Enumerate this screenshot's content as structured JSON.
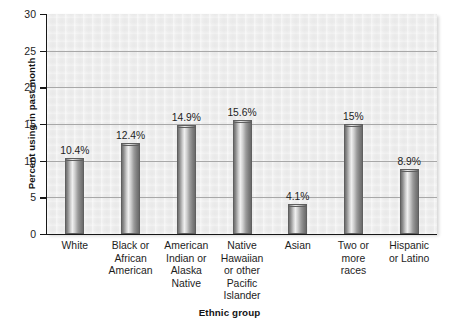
{
  "chart_data": {
    "type": "bar",
    "title": "",
    "xlabel": "Ethnic group",
    "ylabel": "Percent using in past month",
    "ylim": [
      0,
      30
    ],
    "yticks": [
      0,
      5,
      10,
      15,
      20,
      25,
      30
    ],
    "ytick_labels": [
      "0",
      "5",
      "10",
      "15",
      "20",
      "25",
      "30"
    ],
    "grid": true,
    "legend": "none",
    "categories": [
      "White",
      "Black or African American",
      "American Indian or Alaska Native",
      "Native Hawaiian or other Pacific Islander",
      "Asian",
      "Two or more races",
      "Hispanic or Latino"
    ],
    "category_label_lines": [
      [
        "White"
      ],
      [
        "Black or",
        "African",
        "American"
      ],
      [
        "American",
        "Indian or",
        "Alaska",
        "Native"
      ],
      [
        "Native",
        "Hawaiian",
        "or other",
        "Pacific",
        "Islander"
      ],
      [
        "Asian"
      ],
      [
        "Two or",
        "more",
        "races"
      ],
      [
        "Hispanic",
        "or Latino"
      ]
    ],
    "values": [
      10.4,
      12.4,
      14.9,
      15.6,
      4.1,
      15.0,
      8.9
    ],
    "value_labels": [
      "10.4%",
      "12.4%",
      "14.9%",
      "15.6%",
      "4.1%",
      "15%",
      "8.9%"
    ],
    "colors": {
      "plot_background": "#ededed",
      "gridline": "#a8a8a8",
      "axis": "#171717",
      "bar_light": "#efefef",
      "bar_dark": "#6a6a6a",
      "text": "#1d1d1d"
    }
  }
}
